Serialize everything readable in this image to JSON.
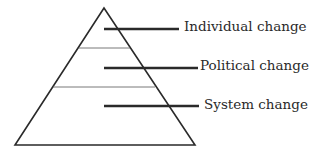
{
  "diagram": {
    "type": "pyramid",
    "levels": [
      {
        "label": "Individual change",
        "position": "top"
      },
      {
        "label": "Political change",
        "position": "middle"
      },
      {
        "label": "System change",
        "position": "bottom"
      }
    ],
    "colors": {
      "stroke": "#2a2a2a",
      "divider": "#6a6a6a",
      "background": "#ffffff"
    }
  }
}
